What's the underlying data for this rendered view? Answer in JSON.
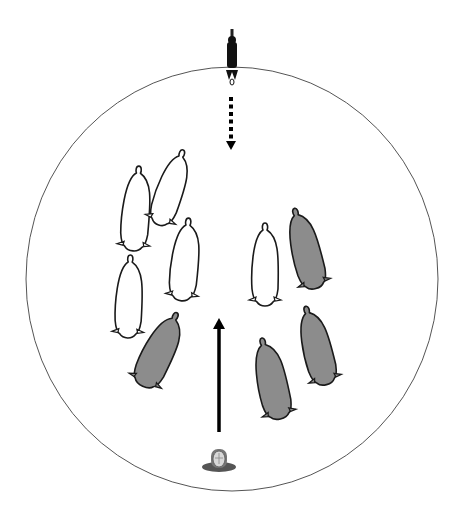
{
  "diagram": {
    "type": "sheep-herding-scene",
    "arena": {
      "cx": 232,
      "cy": 279,
      "rx": 206,
      "ry": 212,
      "stroke": "#555555"
    },
    "colors": {
      "white_sheep_fill": "#ffffff",
      "grey_sheep_fill": "#8c8c8c",
      "outline": "#1a1a1a",
      "arrow": "#000000"
    },
    "handler_top": {
      "x": 232,
      "y": 30,
      "label": "handler-outside"
    },
    "handler_bottom": {
      "x": 219,
      "y": 464,
      "label": "handler-inside"
    },
    "arrows": [
      {
        "kind": "dotted",
        "x": 231,
        "y1": 97,
        "y2": 150,
        "direction": "down"
      },
      {
        "kind": "solid",
        "x": 219,
        "y1": 432,
        "y2": 318,
        "direction": "up"
      }
    ],
    "sheep": [
      {
        "id": "w1",
        "color": "white",
        "cx": 136,
        "cy": 208,
        "len": 84,
        "w": 27,
        "rot": 4
      },
      {
        "id": "w2",
        "color": "white",
        "cx": 171,
        "cy": 187,
        "len": 78,
        "w": 26,
        "rot": 18
      },
      {
        "id": "w3",
        "color": "white",
        "cx": 185,
        "cy": 259,
        "len": 82,
        "w": 27,
        "rot": 5
      },
      {
        "id": "w4",
        "color": "white",
        "cx": 129,
        "cy": 296,
        "len": 82,
        "w": 26,
        "rot": 2
      },
      {
        "id": "w5",
        "color": "white",
        "cx": 265,
        "cy": 264,
        "len": 82,
        "w": 26,
        "rot": 0
      },
      {
        "id": "g1",
        "color": "grey",
        "cx": 305,
        "cy": 248,
        "len": 82,
        "w": 28,
        "rot": -15
      },
      {
        "id": "g2",
        "color": "grey",
        "cx": 160,
        "cy": 349,
        "len": 80,
        "w": 30,
        "rot": 25
      },
      {
        "id": "g3",
        "color": "grey",
        "cx": 271,
        "cy": 378,
        "len": 82,
        "w": 29,
        "rot": -13
      },
      {
        "id": "g4",
        "color": "grey",
        "cx": 316,
        "cy": 345,
        "len": 80,
        "w": 28,
        "rot": -15
      }
    ]
  }
}
